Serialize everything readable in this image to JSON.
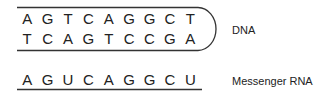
{
  "dna": {
    "label": "DNA",
    "strand_top": [
      "A",
      "G",
      "T",
      "C",
      "A",
      "G",
      "G",
      "C",
      "T"
    ],
    "strand_bottom": [
      "T",
      "C",
      "A",
      "G",
      "T",
      "C",
      "C",
      "G",
      "A"
    ]
  },
  "rna": {
    "label": "Messenger RNA",
    "strand": [
      "A",
      "G",
      "U",
      "C",
      "A",
      "G",
      "G",
      "C",
      "U"
    ]
  },
  "colors": {
    "line": "#333333",
    "text": "#222222"
  }
}
